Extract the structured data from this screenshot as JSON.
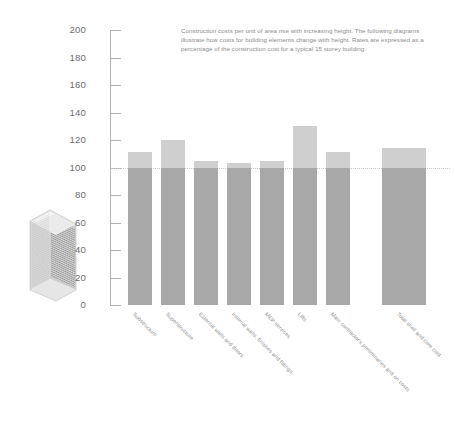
{
  "description": "Construction costs per unit of area rise with increasing height. The following diagrams illustrate how costs for building elements change with height. Rates are expressed as a percentage of the construction cost for a typical 15 storey building.",
  "illustration": {
    "name": "high-rise-tower-illustration"
  },
  "colors": {
    "bar_above_baseline": "#cfcfcf",
    "bar_below_baseline": "#a8a8a8",
    "axis": "#b3b3b3",
    "baseline": "#c9c9c9",
    "tick_text": "#6e6e6e",
    "body_text": "#8d8d8d"
  },
  "chart_data": {
    "type": "bar",
    "title": "",
    "xlabel": "",
    "ylabel": "",
    "ylim": [
      0,
      200
    ],
    "yticks": [
      0,
      20,
      40,
      60,
      80,
      100,
      120,
      140,
      160,
      180,
      200
    ],
    "grid": false,
    "legend": null,
    "baseline": 100,
    "categories": [
      "Substructure",
      "Superstructure",
      "External walls and doors",
      "Internal walls, finishes and fittings",
      "MEP services",
      "Lifts",
      "Main contractor's preliminaries and on costs",
      "Total shell and core cost"
    ],
    "values": [
      111,
      120,
      105,
      103,
      105,
      130,
      111,
      114
    ],
    "units": "%"
  }
}
